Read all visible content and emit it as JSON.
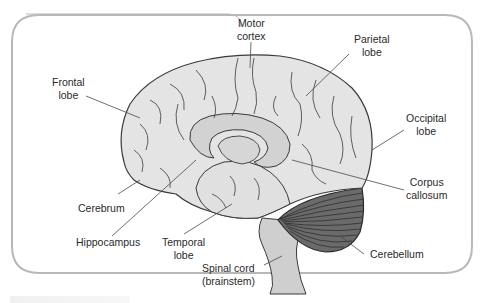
{
  "diagram": {
    "type": "anatomical-illustration",
    "colors": {
      "frame_border": "#b8b8b8",
      "cerebrum_fill": "#e4e4e4",
      "inner_structures_fill": "#d2d2d2",
      "cerebellum_fill": "#5a5a5a",
      "brainstem_fill": "#cfcfcf",
      "outline": "#3a3a3a",
      "leader_line": "#4a4a4a",
      "label_text": "#2a2a2a"
    },
    "labels": {
      "motor_cortex": [
        "Motor",
        "cortex"
      ],
      "parietal_lobe": [
        "Parietal",
        "lobe"
      ],
      "frontal_lobe": [
        "Frontal",
        "lobe"
      ],
      "occipital_lobe": [
        "Occipital",
        "lobe"
      ],
      "corpus_callosum": [
        "Corpus",
        "callosum"
      ],
      "cerebrum": [
        "Cerebrum"
      ],
      "hippocampus": [
        "Hippocampus"
      ],
      "temporal_lobe": [
        "Temporal",
        "lobe"
      ],
      "cerebellum": [
        "Cerebellum"
      ],
      "spinal_cord": [
        "Spinal cord",
        "(brainstem)"
      ]
    }
  }
}
